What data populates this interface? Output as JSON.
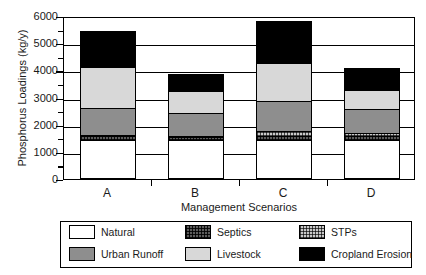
{
  "chart_data": {
    "type": "bar",
    "subtype": "stacked-bar",
    "title": "",
    "xlabel": "Management Scenarios",
    "ylabel": "Phosphorus Loadings (kg/y)",
    "categories": [
      "A",
      "B",
      "C",
      "D"
    ],
    "ylim": [
      0,
      6000
    ],
    "ytick_labels": [
      "0",
      "1000",
      "2000",
      "3000",
      "4000",
      "5000",
      "6000"
    ],
    "ytick_values": [
      0,
      1000,
      2000,
      3000,
      4000,
      5000,
      6000
    ],
    "yminor_values": [
      500,
      1500,
      2500,
      3500,
      4500,
      5500
    ],
    "grid": "horizontal-major",
    "legend_position": "below-axes",
    "series": [
      {
        "name": "Natural",
        "color": "#ffffff",
        "pattern": "solid",
        "values": [
          1450,
          1450,
          1450,
          1450
        ]
      },
      {
        "name": "Septics",
        "color": "#5c5c5c",
        "pattern": "crosshatch-dark",
        "values": [
          130,
          100,
          150,
          130
        ]
      },
      {
        "name": "STPs",
        "color": "#c9c9c9",
        "pattern": "crosshatch-light",
        "values": [
          30,
          30,
          180,
          100
        ]
      },
      {
        "name": "Urban Runoff",
        "color": "#8e8e8e",
        "pattern": "solid",
        "values": [
          1000,
          850,
          1100,
          900
        ]
      },
      {
        "name": "Livestock",
        "color": "#d8d8d8",
        "pattern": "solid",
        "values": [
          1500,
          800,
          1400,
          700
        ]
      },
      {
        "name": "Cropland Erosion",
        "color": "#000000",
        "pattern": "solid",
        "values": [
          1350,
          620,
          1520,
          800
        ]
      }
    ],
    "totals": [
      5460,
      3850,
      5800,
      4080
    ]
  },
  "legend": {
    "items": [
      {
        "label": "Natural",
        "swatch": "natural-swatch"
      },
      {
        "label": "Septics",
        "swatch": "septics-swatch"
      },
      {
        "label": "STPs",
        "swatch": "stps-swatch"
      },
      {
        "label": "Urban Runoff",
        "swatch": "urban-runoff-swatch"
      },
      {
        "label": "Livestock",
        "swatch": "livestock-swatch"
      },
      {
        "label": "Cropland Erosion",
        "swatch": "cropland-erosion-swatch"
      }
    ]
  }
}
